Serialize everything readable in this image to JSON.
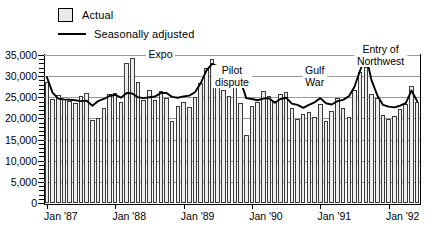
{
  "legend": {
    "items": [
      {
        "key": "actual",
        "label": "Actual",
        "marker": "hatched-square-swatch"
      },
      {
        "key": "seasonally_adjusted",
        "label": "Seasonally adjusted",
        "marker": "solid-line-swatch"
      }
    ]
  },
  "annotations": [
    {
      "name": "expo",
      "text": "Expo",
      "x_pct": 31.0,
      "value": 35000,
      "lines": [
        "Expo"
      ]
    },
    {
      "name": "pilot-dispute",
      "text": "Pilot dispute",
      "x_pct": 50.0,
      "value": 30000,
      "lines": [
        "Pilot",
        "dispute"
      ]
    },
    {
      "name": "gulf-war",
      "text": "Gulf War",
      "x_pct": 72.0,
      "value": 30000,
      "lines": [
        "Gulf",
        "War"
      ]
    },
    {
      "name": "entry-of-northwest",
      "text": "Entry of Northwest",
      "x_pct": 89.5,
      "value": 35000,
      "lines": [
        "Entry of",
        "Northwest"
      ]
    }
  ],
  "chart_data": {
    "type": "bar",
    "title": "",
    "xlabel": "",
    "ylabel": "",
    "ylim": [
      0,
      35000
    ],
    "yticks": [
      0,
      5000,
      10000,
      15000,
      20000,
      25000,
      30000,
      35000
    ],
    "ytick_labels": [
      "0",
      "5,000",
      "10,000",
      "15,000",
      "20,000",
      "25,000",
      "30,000",
      "35,000"
    ],
    "grid": true,
    "legend_position": "top-left",
    "xtick_labels": [
      "Jan '87",
      "Jan '88",
      "Jan '89",
      "Jan '90",
      "Jan '91",
      "Jan '92"
    ],
    "xtick_indices": [
      0,
      12,
      24,
      36,
      48,
      60
    ],
    "x": [
      "Jan '87",
      "Feb '87",
      "Mar '87",
      "Apr '87",
      "May '87",
      "Jun '87",
      "Jul '87",
      "Aug '87",
      "Sep '87",
      "Oct '87",
      "Nov '87",
      "Dec '87",
      "Jan '88",
      "Feb '88",
      "Mar '88",
      "Apr '88",
      "May '88",
      "Jun '88",
      "Jul '88",
      "Aug '88",
      "Sep '88",
      "Oct '88",
      "Nov '88",
      "Dec '88",
      "Jan '89",
      "Feb '89",
      "Mar '89",
      "Apr '89",
      "May '89",
      "Jun '89",
      "Jul '89",
      "Aug '89",
      "Sep '89",
      "Oct '89",
      "Nov '89",
      "Dec '89",
      "Jan '90",
      "Feb '90",
      "Mar '90",
      "Apr '90",
      "May '90",
      "Jun '90",
      "Jul '90",
      "Aug '90",
      "Sep '90",
      "Oct '90",
      "Nov '90",
      "Dec '90",
      "Jan '91",
      "Feb '91",
      "Mar '91",
      "Apr '91",
      "May '91",
      "Jun '91",
      "Jul '91",
      "Aug '91",
      "Sep '91",
      "Oct '91",
      "Nov '91",
      "Dec '91",
      "Jan '92",
      "Feb '92",
      "Mar '92",
      "Apr '92",
      "May '92",
      "Jun '92"
    ],
    "series": [
      {
        "name": "Actual",
        "type": "bar",
        "values": [
          28700,
          24500,
          25600,
          24600,
          24200,
          23700,
          25400,
          25900,
          19600,
          20200,
          22400,
          25700,
          26100,
          24000,
          33000,
          34400,
          28700,
          24400,
          26700,
          24400,
          26600,
          24900,
          19400,
          22900,
          23900,
          22700,
          25000,
          28300,
          31900,
          34000,
          31100,
          26700,
          25300,
          27900,
          23600,
          16200,
          22900,
          24000,
          26600,
          25200,
          24100,
          25700,
          26300,
          22400,
          19800,
          21100,
          21600,
          20300,
          23300,
          19500,
          21800,
          24900,
          22400,
          20400,
          26800,
          31100,
          32200,
          25800,
          24900,
          20700,
          19900,
          20500,
          22300,
          23400,
          27700,
          23800
        ]
      },
      {
        "name": "Seasonally adjusted",
        "type": "line",
        "values": [
          29800,
          26100,
          24700,
          24500,
          24400,
          24300,
          24100,
          24200,
          23000,
          24100,
          24600,
          25300,
          25600,
          24900,
          26000,
          25900,
          25000,
          24800,
          25000,
          25200,
          26000,
          26000,
          25100,
          24900,
          25200,
          25400,
          26200,
          28300,
          31300,
          32900,
          32300,
          32000,
          32200,
          31800,
          28900,
          24800,
          24600,
          24300,
          24700,
          24800,
          23700,
          24600,
          24900,
          23500,
          23200,
          22500,
          23200,
          23800,
          24800,
          23600,
          23300,
          24100,
          24400,
          25200,
          27500,
          31400,
          34900,
          29000,
          25500,
          23200,
          22800,
          22600,
          23000,
          23600,
          26600,
          24100
        ]
      }
    ]
  }
}
